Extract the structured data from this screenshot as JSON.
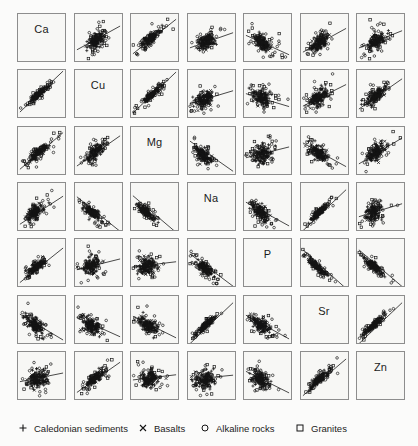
{
  "figure": {
    "type": "scatterplot-matrix",
    "variables": [
      "Ca",
      "Cu",
      "Mg",
      "Na",
      "P",
      "Sr",
      "Zn"
    ],
    "n_rows": 7,
    "n_cols": 7,
    "panel_background": "#f7f7f5",
    "panel_border": "#8d8d8d",
    "ink": "#1b1b1b"
  },
  "legend": {
    "items": [
      {
        "marker": "plus-icon",
        "label": "Caledonian sediments",
        "x": 18
      },
      {
        "marker": "cross-icon",
        "label": "Basalts",
        "x": 138
      },
      {
        "marker": "circle-icon",
        "label": "Alkaline rocks",
        "x": 200
      },
      {
        "marker": "square-icon",
        "label": "Granites",
        "x": 295
      }
    ]
  },
  "chart_data": {
    "type": "scatter",
    "title": "",
    "xlabel": "",
    "ylabel": "",
    "variables": [
      "Ca",
      "Cu",
      "Mg",
      "Na",
      "P",
      "Sr",
      "Zn"
    ],
    "groups": [
      {
        "name": "Caledonian sediments",
        "marker": "plus",
        "count": 120
      },
      {
        "name": "Basalts",
        "marker": "cross",
        "count": 34
      },
      {
        "name": "Alkaline rocks",
        "marker": "circle",
        "count": 38
      },
      {
        "name": "Granites",
        "marker": "square",
        "count": 28
      }
    ],
    "grid": false,
    "legend_position": "bottom",
    "axis_ticks": false,
    "note": "Pairwise panels of 7 element concentrations; each off-diagonal panel carries a fitted regression line. Slopes below are normalized panel-space slopes (dy/dx in panel units), positive = rising left-to-right.",
    "panel_slopes": [
      [
        null,
        0.55,
        0.8,
        0.35,
        -0.45,
        0.55,
        0.4
      ],
      [
        0.95,
        null,
        0.95,
        0.3,
        -0.3,
        0.5,
        0.7
      ],
      [
        0.85,
        0.7,
        null,
        -0.7,
        0.25,
        -0.55,
        0.6
      ],
      [
        0.65,
        -0.8,
        -0.85,
        null,
        -0.55,
        0.95,
        0.3
      ],
      [
        0.8,
        0.25,
        0.12,
        -0.75,
        null,
        -0.9,
        -0.85
      ],
      [
        -0.6,
        -0.45,
        -0.5,
        0.95,
        -0.55,
        null,
        0.95
      ],
      [
        0.2,
        0.7,
        0.12,
        0.1,
        -0.5,
        0.85,
        null
      ]
    ],
    "panel_cluster_centers": [
      [
        null,
        [
          0.46,
          0.55
        ],
        [
          0.42,
          0.52
        ],
        [
          0.38,
          0.6
        ],
        [
          0.4,
          0.62
        ],
        [
          0.4,
          0.6
        ],
        [
          0.4,
          0.58
        ]
      ],
      [
        [
          0.45,
          0.5
        ],
        null,
        [
          0.45,
          0.52
        ],
        [
          0.35,
          0.62
        ],
        [
          0.38,
          0.6
        ],
        [
          0.38,
          0.58
        ],
        [
          0.4,
          0.55
        ]
      ],
      [
        [
          0.42,
          0.55
        ],
        [
          0.42,
          0.55
        ],
        null,
        [
          0.32,
          0.58
        ],
        [
          0.38,
          0.58
        ],
        [
          0.38,
          0.55
        ],
        [
          0.4,
          0.55
        ]
      ],
      [
        [
          0.35,
          0.62
        ],
        [
          0.35,
          0.62
        ],
        [
          0.32,
          0.62
        ],
        null,
        [
          0.35,
          0.62
        ],
        [
          0.38,
          0.62
        ],
        [
          0.35,
          0.62
        ]
      ],
      [
        [
          0.38,
          0.6
        ],
        [
          0.35,
          0.58
        ],
        [
          0.35,
          0.58
        ],
        [
          0.35,
          0.62
        ],
        null,
        [
          0.35,
          0.6
        ],
        [
          0.35,
          0.58
        ]
      ],
      [
        [
          0.36,
          0.62
        ],
        [
          0.36,
          0.62
        ],
        [
          0.36,
          0.62
        ],
        [
          0.38,
          0.62
        ],
        [
          0.36,
          0.62
        ],
        null,
        [
          0.36,
          0.62
        ]
      ],
      [
        [
          0.4,
          0.58
        ],
        [
          0.4,
          0.58
        ],
        [
          0.4,
          0.58
        ],
        [
          0.38,
          0.58
        ],
        [
          0.36,
          0.6
        ],
        [
          0.38,
          0.58
        ],
        null
      ]
    ]
  }
}
